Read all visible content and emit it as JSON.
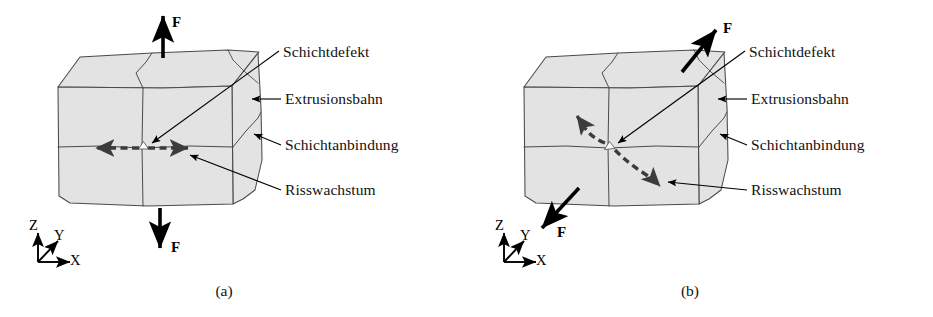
{
  "figure": {
    "width": 933,
    "height": 317,
    "background": "#ffffff",
    "body_fill": "#e3e3e3",
    "outline_color": "#4a4a4a",
    "ink_color": "#000000",
    "crack_color": "#3c3c3c"
  },
  "panels": [
    {
      "id": "a",
      "caption": "(a)",
      "load_case": "uniaxial-tension-z",
      "forces": [
        {
          "name": "force-up",
          "label": "F",
          "direction": "up"
        },
        {
          "name": "force-down",
          "label": "F",
          "direction": "down"
        }
      ],
      "crack": {
        "name": "crack-path-horizontal",
        "style": "dashed-double-arrow",
        "shape": "straight-horizontal"
      },
      "defect": {
        "name": "layer-defect-marker",
        "shape": "diamond",
        "fill": "#ffffff"
      },
      "callouts": [
        {
          "key": "schichtdefekt",
          "label": "Schichtdefekt",
          "target": "layer-defect-marker"
        },
        {
          "key": "extrusionsbahn",
          "label": "Extrusionsbahn",
          "target": "extrusion-path-face"
        },
        {
          "key": "schichtanbindung",
          "label": "Schichtanbindung",
          "target": "layer-bond-line"
        },
        {
          "key": "risswachstum",
          "label": "Risswachstum",
          "target": "crack-path-horizontal"
        }
      ],
      "axes": {
        "z": "Z",
        "y": "Y",
        "x": "X"
      }
    },
    {
      "id": "b",
      "caption": "(b)",
      "load_case": "shear-diagonal",
      "forces": [
        {
          "name": "force-up-right",
          "label": "F",
          "direction": "up-right"
        },
        {
          "name": "force-down-left",
          "label": "F",
          "direction": "down-left"
        }
      ],
      "crack": {
        "name": "crack-path-diagonal",
        "style": "dashed-double-arrow",
        "shape": "s-curve-diagonal"
      },
      "defect": {
        "name": "layer-defect-marker",
        "shape": "diamond",
        "fill": "#ffffff"
      },
      "callouts": [
        {
          "key": "schichtdefekt",
          "label": "Schichtdefekt",
          "target": "layer-defect-marker"
        },
        {
          "key": "extrusionsbahn",
          "label": "Extrusionsbahn",
          "target": "extrusion-path-face"
        },
        {
          "key": "schichtanbindung",
          "label": "Schichtanbindung",
          "target": "layer-bond-line"
        },
        {
          "key": "risswachstum",
          "label": "Risswachstum",
          "target": "crack-path-diagonal"
        }
      ],
      "axes": {
        "z": "Z",
        "y": "Y",
        "x": "X"
      }
    }
  ]
}
